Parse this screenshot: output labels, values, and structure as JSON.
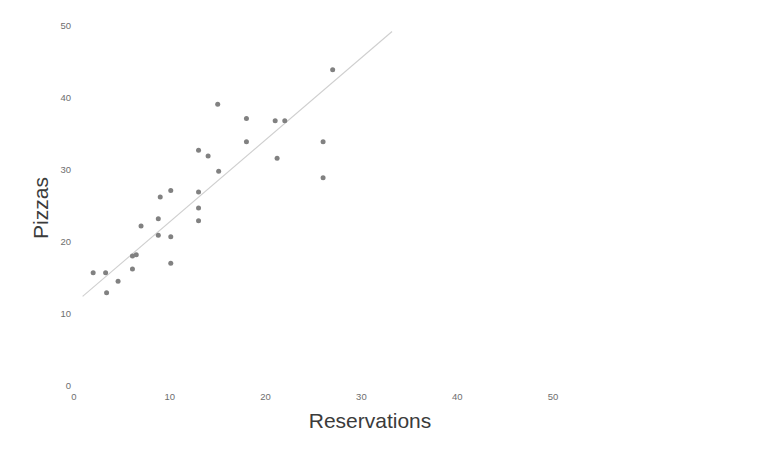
{
  "chart_data": {
    "type": "scatter",
    "title": "",
    "subtitle": "",
    "xlabel": "Reservations",
    "ylabel": "Pizzas",
    "xlim": [
      0,
      52
    ],
    "ylim": [
      0,
      52
    ],
    "grid": false,
    "legend": "none",
    "x_ticks": [
      0,
      10,
      20,
      30,
      40,
      50
    ],
    "y_ticks": [
      0,
      10,
      20,
      30,
      40,
      50
    ],
    "x_tick_labels": [
      "0",
      "10",
      "20",
      "30",
      "40",
      "50"
    ],
    "y_tick_labels": [
      "0",
      "10",
      "20",
      "30",
      "40",
      "50"
    ],
    "point_color": "#818181",
    "point_size": 5,
    "series": [
      {
        "name": "Pizzas sold vs reservations",
        "marker": "circle",
        "points": [
          {
            "x": 2.0,
            "y": 15.6
          },
          {
            "x": 3.3,
            "y": 15.6
          },
          {
            "x": 3.4,
            "y": 12.8
          },
          {
            "x": 4.6,
            "y": 14.4
          },
          {
            "x": 6.1,
            "y": 17.9
          },
          {
            "x": 6.1,
            "y": 16.1
          },
          {
            "x": 6.5,
            "y": 18.1
          },
          {
            "x": 7.0,
            "y": 22.1
          },
          {
            "x": 8.8,
            "y": 20.8
          },
          {
            "x": 8.8,
            "y": 23.1
          },
          {
            "x": 9.0,
            "y": 26.1
          },
          {
            "x": 10.1,
            "y": 27.0
          },
          {
            "x": 10.1,
            "y": 20.6
          },
          {
            "x": 10.1,
            "y": 16.9
          },
          {
            "x": 13.0,
            "y": 32.6
          },
          {
            "x": 13.0,
            "y": 26.8
          },
          {
            "x": 13.0,
            "y": 24.6
          },
          {
            "x": 13.0,
            "y": 22.8
          },
          {
            "x": 14.0,
            "y": 31.8
          },
          {
            "x": 15.0,
            "y": 39.0
          },
          {
            "x": 15.1,
            "y": 29.7
          },
          {
            "x": 18.0,
            "y": 37.0
          },
          {
            "x": 18.0,
            "y": 33.8
          },
          {
            "x": 21.0,
            "y": 36.7
          },
          {
            "x": 22.0,
            "y": 36.7
          },
          {
            "x": 21.2,
            "y": 31.5
          },
          {
            "x": 26.0,
            "y": 33.8
          },
          {
            "x": 26.0,
            "y": 28.8
          },
          {
            "x": 27.0,
            "y": 43.8
          }
        ]
      }
    ],
    "trend_line": {
      "name": "linear-fit",
      "color": "#cfcfcf",
      "x_start": 0.9,
      "y_start": 12.3,
      "x_end": 33.2,
      "y_end": 49.1
    }
  },
  "axis": {
    "x_title": "Reservations",
    "y_title": "Pizzas"
  }
}
